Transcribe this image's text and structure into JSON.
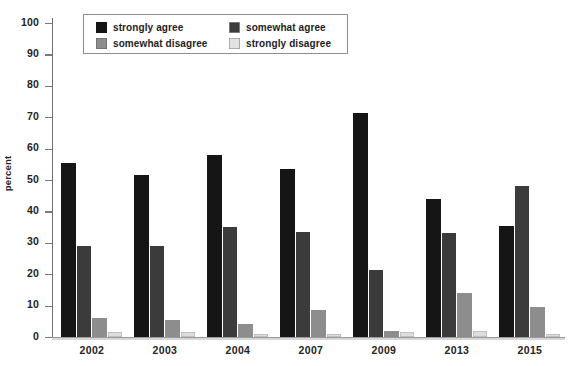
{
  "chart_data": {
    "type": "bar",
    "title": "",
    "xlabel": "",
    "ylabel": "percent",
    "ylim": [
      0,
      100
    ],
    "grid": false,
    "legend_position": "top-left-inside",
    "categories": [
      "2002",
      "2003",
      "2004",
      "2007",
      "2009",
      "2013",
      "2015"
    ],
    "y_ticks": [
      "0",
      "10",
      "20",
      "30",
      "40",
      "50",
      "60",
      "70",
      "80",
      "90",
      "100"
    ],
    "series": [
      {
        "name": "strongly agree",
        "color": "#151515",
        "values": [
          55.5,
          51.5,
          58.0,
          53.5,
          71.5,
          44.0,
          35.5
        ]
      },
      {
        "name": "somewhat agree",
        "color": "#3b3b3b",
        "values": [
          29.0,
          29.0,
          35.0,
          33.5,
          21.5,
          33.0,
          48.0
        ]
      },
      {
        "name": "somewhat disagree",
        "color": "#8d8d8d",
        "values": [
          6.0,
          5.5,
          4.0,
          8.5,
          2.0,
          14.0,
          9.5
        ]
      },
      {
        "name": "strongly disagree",
        "color": "#dddddd",
        "values": [
          1.5,
          1.5,
          1.0,
          1.0,
          1.5,
          2.0,
          1.0
        ]
      }
    ]
  },
  "axis": {
    "y_label": "percent"
  },
  "legend": {
    "items": [
      {
        "label": "strongly agree"
      },
      {
        "label": "somewhat agree"
      },
      {
        "label": "somewhat disagree"
      },
      {
        "label": "strongly disagree"
      }
    ]
  },
  "title": {
    "text": ""
  }
}
